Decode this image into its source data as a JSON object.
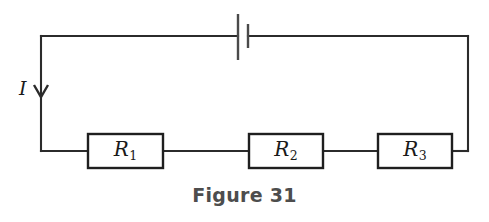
{
  "figure": {
    "caption": "Figure 31",
    "type": "series-circuit-schematic",
    "background_color": "#ffffff",
    "wire_color": "#2b2b2b",
    "label_color": "#1a1a1a",
    "caption_color": "#4d4d4d"
  },
  "circuit": {
    "loop": {
      "left_x": 41,
      "right_x": 468,
      "top_y": 36,
      "bottom_y": 151
    },
    "current": {
      "symbol": "I",
      "direction": "down",
      "arrow_x": 41,
      "arrow_y": 92,
      "label_x": 19,
      "label_y": 79
    },
    "battery": {
      "name": "battery-symbol",
      "long_plate": {
        "x": 238,
        "y1": 14,
        "y2": 60
      },
      "short_plate": {
        "x": 248,
        "y1": 24,
        "y2": 48
      },
      "plate_color": "#4a4a4a"
    },
    "resistors": [
      {
        "id": "r1",
        "label": "R",
        "subscript": "1",
        "x": 88,
        "y": 134,
        "width": 75,
        "height": 34
      },
      {
        "id": "r2",
        "label": "R",
        "subscript": "2",
        "x": 249,
        "y": 134,
        "width": 74,
        "height": 34
      },
      {
        "id": "r3",
        "label": "R",
        "subscript": "3",
        "x": 378,
        "y": 134,
        "width": 74,
        "height": 34
      }
    ]
  }
}
